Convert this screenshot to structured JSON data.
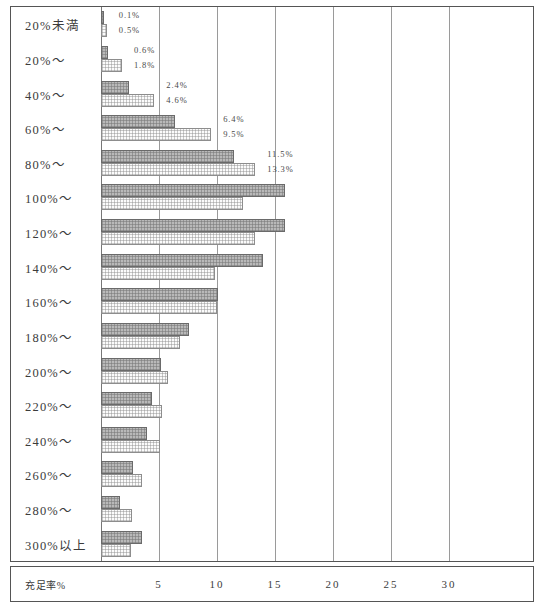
{
  "chart_data": {
    "type": "bar",
    "orientation": "horizontal",
    "title": "",
    "xlabel": "充足率%",
    "ylabel": "",
    "xlim": [
      0,
      35
    ],
    "grid": true,
    "legend": "none",
    "xticks": [
      "5",
      "10",
      "15",
      "20",
      "25",
      "30"
    ],
    "xtick_values": [
      5,
      10,
      15,
      20,
      25,
      30
    ],
    "categories": [
      "20%未満",
      "20%～",
      "40%～",
      "60%～",
      "80%～",
      "100%～",
      "120%～",
      "140%～",
      "160%～",
      "180%～",
      "200%～",
      "220%～",
      "240%～",
      "260%～",
      "280%～",
      "300%以上"
    ],
    "series": [
      {
        "name": "series-a",
        "style": "dark-hatched",
        "values": [
          0.1,
          0.6,
          2.4,
          6.4,
          11.5,
          15.9,
          15.9,
          14.0,
          10.1,
          7.6,
          5.2,
          4.4,
          4.0,
          2.8,
          1.6,
          3.5
        ]
      },
      {
        "name": "series-b",
        "style": "light-dotted",
        "values": [
          0.5,
          1.8,
          4.6,
          9.5,
          13.3,
          12.2,
          13.3,
          9.8,
          10.0,
          6.8,
          5.8,
          5.3,
          5.1,
          3.5,
          2.7,
          2.6
        ]
      }
    ],
    "annotations": [
      {
        "row": 0,
        "a": "0.1%",
        "b": "0.5%"
      },
      {
        "row": 1,
        "a": "0.6%",
        "b": "1.8%"
      },
      {
        "row": 2,
        "a": "2.4%",
        "b": "4.6%"
      },
      {
        "row": 3,
        "a": "6.4%",
        "b": "9.5%"
      },
      {
        "row": 4,
        "a": "11.5%",
        "b": "13.3%"
      }
    ],
    "colors": {
      "series_a_fill": "#b9b9b9",
      "series_a_border": "#6a6a6a",
      "series_b_fill": "#fbfbfb",
      "series_b_border": "#8d8d8d",
      "grid": "#9a9a9a",
      "frame": "#555555",
      "text": "#3b3b3b"
    }
  }
}
